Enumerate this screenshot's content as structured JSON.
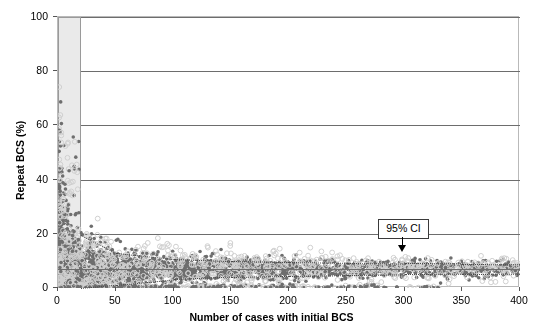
{
  "chart_data": {
    "type": "scatter",
    "title": "",
    "xlabel": "Number of cases with initial BCS",
    "ylabel": "Repeat BCS (%)",
    "xlim": [
      0,
      400
    ],
    "ylim": [
      0,
      100
    ],
    "xticks": [
      0,
      50,
      100,
      150,
      200,
      250,
      300,
      350,
      400
    ],
    "yticks": [
      0,
      20,
      40,
      60,
      80,
      100
    ],
    "grid": "horizontal",
    "legend": "none",
    "mean_line": 7.0,
    "ci_upper_at_x": [
      [
        20,
        19.5
      ],
      [
        50,
        13.0
      ],
      [
        100,
        10.8
      ],
      [
        150,
        10.0
      ],
      [
        200,
        9.6
      ],
      [
        250,
        9.3
      ],
      [
        300,
        9.1
      ],
      [
        350,
        9.0
      ],
      [
        400,
        8.9
      ]
    ],
    "ci_lower_at_x": [
      [
        20,
        0.0
      ],
      [
        50,
        1.2
      ],
      [
        100,
        3.2
      ],
      [
        150,
        4.1
      ],
      [
        200,
        4.5
      ],
      [
        250,
        4.8
      ],
      [
        300,
        5.0
      ],
      [
        350,
        5.1
      ],
      [
        400,
        5.2
      ]
    ],
    "shaded_region": {
      "x_from": 0,
      "x_to": 20,
      "y_from": 0,
      "y_to": 100
    },
    "series": [
      {
        "name": "dark-filled-markers",
        "color": "#6e6e6e",
        "marker": "filled-circle"
      },
      {
        "name": "light-open-markers",
        "color": "#cfcfcf",
        "marker": "open-circle"
      }
    ],
    "annotations": [
      {
        "label": "95% CI",
        "x": 300,
        "y": 14.5,
        "arrow_to_y": 9.4
      }
    ]
  },
  "axes": {
    "x_title": "Number of cases with initial BCS",
    "y_title": "Repeat BCS (%)",
    "x_tick_labels": [
      "0",
      "50",
      "100",
      "150",
      "200",
      "250",
      "300",
      "350",
      "400"
    ],
    "y_tick_labels": [
      "0",
      "20",
      "40",
      "60",
      "80",
      "100"
    ]
  },
  "annotation": {
    "ci_label": "95% CI"
  },
  "colors": {
    "dark_marker": "#6e6e6e",
    "light_marker": "#cfcfcf",
    "grid": "#6d6d6d",
    "frame": "#b9b9b9",
    "shade": "#eaeaea",
    "background": "#ffffff"
  }
}
